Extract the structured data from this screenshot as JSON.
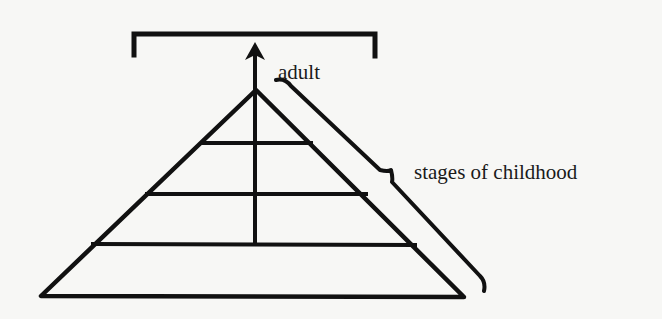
{
  "diagram": {
    "type": "pyramid-growth-diagram",
    "labels": {
      "adult": "adult",
      "stages": "stages of childhood"
    },
    "colors": {
      "background": "#f7f7f5",
      "ink": "#111111"
    },
    "pyramid": {
      "apex": [
        256,
        90
      ],
      "base_left": [
        40,
        296
      ],
      "base_right": [
        464,
        297
      ],
      "levels": 4,
      "horizontal_lines": [
        {
          "y": 143,
          "x1": 202,
          "x2": 310
        },
        {
          "y": 193,
          "x1": 147,
          "x2": 366
        },
        {
          "y": 244,
          "x1": 93,
          "x2": 414
        }
      ],
      "center_line": {
        "x": 255,
        "y1": 90,
        "y2": 244
      }
    },
    "arrow": {
      "from": [
        255,
        90
      ],
      "to": [
        255,
        50
      ],
      "direction": "up"
    },
    "top_bracket": {
      "x1": 133,
      "x2": 376,
      "y": 33,
      "tick_bottom": 55
    },
    "side_brace": {
      "start": [
        276,
        80
      ],
      "notch": [
        392,
        175
      ],
      "end": [
        485,
        290
      ]
    }
  }
}
